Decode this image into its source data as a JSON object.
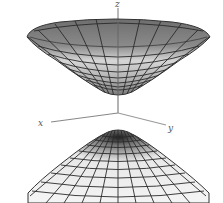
{
  "figure": {
    "axes": {
      "x_label": "x",
      "y_label": "y",
      "z_label": "z"
    },
    "colors": {
      "upper_sheet_outer": "#7c7c7c",
      "upper_sheet_inner": "#c8c8c8",
      "lower_sheet": "#eeeeee",
      "mesh": "#2a2a2a",
      "axis": "#777777"
    }
  }
}
